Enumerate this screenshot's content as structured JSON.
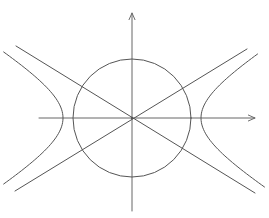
{
  "diagram": {
    "title": "",
    "colors": {
      "background": "#ffffff",
      "stroke": "#555555",
      "axis": "#666666"
    },
    "origin": {
      "x": 132,
      "y": 118
    },
    "x_axis": {
      "x1": 39,
      "y1": 118,
      "x2": 255,
      "y2": 118,
      "arrow": "right"
    },
    "y_axis": {
      "x1": 132,
      "y1": 211,
      "x2": 132,
      "y2": 13,
      "arrow": "up"
    },
    "circle": {
      "cx": 132,
      "cy": 118,
      "r": 59
    },
    "hyperbola": {
      "a": 69,
      "slope": 0.61,
      "left_branch": {
        "vertex_x": 62,
        "top": {
          "x": 15,
          "y": 52
        },
        "bottom": {
          "x": 14,
          "y": 184
        }
      },
      "right_branch": {
        "vertex_x": 200,
        "top": {
          "x": 250,
          "y": 54
        },
        "bottom": {
          "x": 255,
          "y": 187
        }
      }
    },
    "asymptotes": [
      {
        "name": "descending",
        "x1": 16,
        "y1": 46,
        "x2": 255,
        "y2": 193
      },
      {
        "name": "ascending",
        "x1": 15,
        "y1": 191,
        "x2": 247,
        "y2": 49
      }
    ],
    "labels": []
  }
}
